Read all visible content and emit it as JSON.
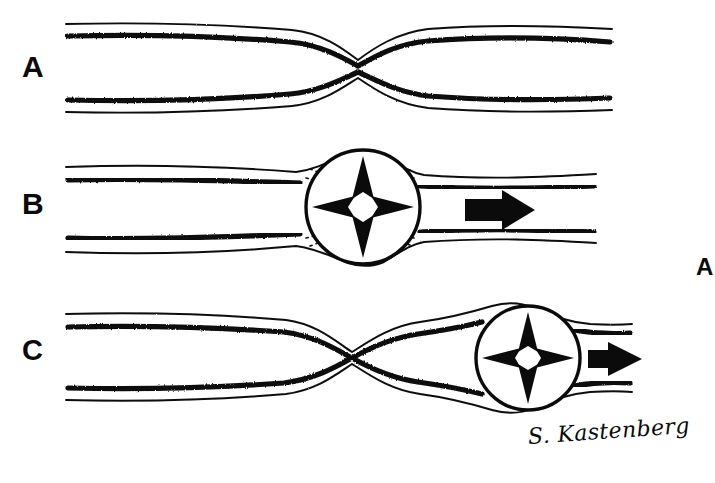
{
  "figure": {
    "background_color": "#ffffff",
    "ink_color": "#0b0b0b",
    "width": 715,
    "height": 483
  },
  "panels": [
    {
      "id": "a",
      "label": "A",
      "caption": "Stenotic vessel segment with concentric narrowing at mid-portion",
      "has_balloon": false,
      "has_flow_arrow": false,
      "stenosis_center_x": 360,
      "stenosis_center_y": 70
    },
    {
      "id": "b",
      "label": "B",
      "caption": "Inflated balloon dilating the stenosis; dotted outline shows the original narrowed lumen",
      "has_balloon": true,
      "has_flow_arrow": true,
      "balloon_center_x": 363,
      "balloon_center_y": 207,
      "balloon_radius": 57,
      "radial_arrow_count": 4,
      "radial_arrow_directions": [
        "up",
        "down",
        "left",
        "right"
      ],
      "flow_arrow_direction": "right"
    },
    {
      "id": "c",
      "label": "C",
      "caption": "Balloon advanced distally; residual proximal stenosis remains with further dilation",
      "has_balloon": true,
      "has_flow_arrow": true,
      "balloon_center_x": 528,
      "balloon_center_y": 358,
      "balloon_radius": 52,
      "radial_arrow_count": 4,
      "radial_arrow_directions": [
        "up",
        "down",
        "left",
        "right"
      ],
      "flow_arrow_direction": "right",
      "stenosis_center_x": 355,
      "stenosis_center_y": 358
    }
  ],
  "corner_label": {
    "text": "A"
  },
  "signature": {
    "text": "S. Kastenberg"
  },
  "icon_names": {
    "radial_arrow": "expansion-arrow-icon",
    "flow_arrow": "flow-direction-arrow-icon",
    "balloon": "balloon-circle-icon",
    "vessel": "vessel-wall-icon",
    "dotted_lumen": "dotted-original-lumen-icon"
  }
}
